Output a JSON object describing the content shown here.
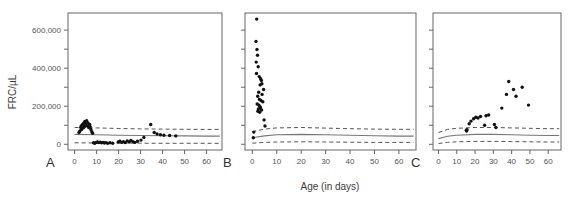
{
  "figure": {
    "xlabel": "Age (in days)",
    "ylabel": "FRC/µL",
    "panel_labels": [
      "A",
      "B",
      "C"
    ]
  },
  "chart_data": [
    {
      "type": "scatter",
      "panel": "A",
      "title": "",
      "xlabel": "Age (in days)",
      "ylabel": "FRC/µL",
      "xlim": [
        -3,
        67
      ],
      "ylim": [
        -30000,
        690000
      ],
      "xticks": [
        0,
        10,
        20,
        30,
        40,
        50,
        60
      ],
      "xtick_labels": [
        "0",
        "10",
        "20",
        "30",
        "40",
        "50",
        "60"
      ],
      "yticks": [
        0,
        200000,
        400000,
        600000
      ],
      "ytick_labels": [
        "0",
        "200,000",
        "400,000",
        "600,000"
      ],
      "yminor_ticks": [
        100000,
        300000,
        500000,
        700000
      ],
      "grid": false,
      "legend": "none",
      "points": [
        [
          2.0,
          62000
        ],
        [
          2.4,
          70000
        ],
        [
          2.8,
          88000
        ],
        [
          3.0,
          96000
        ],
        [
          3.2,
          78000
        ],
        [
          3.6,
          104000
        ],
        [
          3.9,
          86000
        ],
        [
          4.2,
          112000
        ],
        [
          4.4,
          92000
        ],
        [
          4.7,
          120000
        ],
        [
          4.9,
          100000
        ],
        [
          5.2,
          108000
        ],
        [
          5.5,
          124000
        ],
        [
          5.8,
          96000
        ],
        [
          6.1,
          112000
        ],
        [
          6.4,
          88000
        ],
        [
          6.8,
          104000
        ],
        [
          7.1,
          92000
        ],
        [
          7.4,
          78000
        ],
        [
          7.8,
          66000
        ],
        [
          8.2,
          58000
        ],
        [
          8.6,
          8000
        ],
        [
          9.2,
          6000
        ],
        [
          9.8,
          10000
        ],
        [
          10.4,
          12000
        ],
        [
          11.0,
          9000
        ],
        [
          11.6,
          11000
        ],
        [
          12.2,
          8000
        ],
        [
          12.9,
          10000
        ],
        [
          13.5,
          7000
        ],
        [
          14.2,
          9000
        ],
        [
          15.0,
          6000
        ],
        [
          16.1,
          8000
        ],
        [
          17.3,
          5000
        ],
        [
          19.8,
          12000
        ],
        [
          20.6,
          16000
        ],
        [
          21.4,
          10000
        ],
        [
          22.2,
          14000
        ],
        [
          23.0,
          9000
        ],
        [
          23.9,
          18000
        ],
        [
          24.8,
          12000
        ],
        [
          25.6,
          20000
        ],
        [
          26.5,
          14000
        ],
        [
          27.4,
          10000
        ],
        [
          28.6,
          16000
        ],
        [
          30.2,
          22000
        ],
        [
          31.5,
          36000
        ],
        [
          34.6,
          104000
        ],
        [
          36.2,
          62000
        ],
        [
          37.5,
          54000
        ],
        [
          39.0,
          50000
        ],
        [
          40.6,
          48000
        ],
        [
          43.2,
          46000
        ],
        [
          46.0,
          44000
        ]
      ],
      "reference_band": {
        "center": [
          [
            0,
            52000
          ],
          [
            10,
            50000
          ],
          [
            20,
            48000
          ],
          [
            30,
            46000
          ],
          [
            40,
            45000
          ],
          [
            50,
            44000
          ],
          [
            60,
            43000
          ],
          [
            66,
            43000
          ]
        ],
        "upper": [
          [
            0,
            88000
          ],
          [
            10,
            86000
          ],
          [
            20,
            83000
          ],
          [
            30,
            81000
          ],
          [
            40,
            80000
          ],
          [
            50,
            79000
          ],
          [
            60,
            78000
          ],
          [
            66,
            78000
          ]
        ],
        "lower": [
          [
            0,
            8000
          ],
          [
            10,
            7000
          ],
          [
            20,
            6000
          ],
          [
            30,
            6000
          ],
          [
            40,
            5000
          ],
          [
            50,
            5000
          ],
          [
            60,
            5000
          ],
          [
            66,
            5000
          ]
        ]
      }
    },
    {
      "type": "scatter",
      "panel": "B",
      "title": "",
      "xlabel": "Age (in days)",
      "ylabel": "FRC/µL",
      "xlim": [
        -3,
        67
      ],
      "ylim": [
        -30000,
        690000
      ],
      "xticks": [
        0,
        10,
        20,
        30,
        40,
        50,
        60
      ],
      "xtick_labels": [
        "0",
        "10",
        "20",
        "30",
        "40",
        "50",
        "60"
      ],
      "yticks": [
        0,
        200000,
        400000,
        600000
      ],
      "ytick_labels": [
        "0",
        "200,000",
        "400,000",
        "600,000"
      ],
      "yminor_ticks": [
        100000,
        300000,
        500000,
        700000
      ],
      "grid": false,
      "legend": "none",
      "points": [
        [
          1.8,
          658000
        ],
        [
          1.5,
          540000
        ],
        [
          1.9,
          498000
        ],
        [
          2.1,
          468000
        ],
        [
          1.6,
          432000
        ],
        [
          2.4,
          408000
        ],
        [
          1.7,
          372000
        ],
        [
          2.8,
          356000
        ],
        [
          3.4,
          344000
        ],
        [
          3.7,
          336000
        ],
        [
          3.9,
          318000
        ],
        [
          3.2,
          312000
        ],
        [
          4.6,
          288000
        ],
        [
          2.6,
          274000
        ],
        [
          4.0,
          262000
        ],
        [
          2.2,
          252000
        ],
        [
          2.9,
          236000
        ],
        [
          3.5,
          230000
        ],
        [
          4.3,
          224000
        ],
        [
          2.0,
          212000
        ],
        [
          2.7,
          206000
        ],
        [
          3.1,
          198000
        ],
        [
          3.3,
          192000
        ],
        [
          2.5,
          186000
        ],
        [
          3.8,
          180000
        ],
        [
          2.3,
          174000
        ],
        [
          3.0,
          168000
        ],
        [
          4.8,
          128000
        ],
        [
          5.2,
          96000
        ],
        [
          0.6,
          64000
        ],
        [
          0.4,
          34000
        ]
      ],
      "reference_band": {
        "center": [
          [
            0,
            34000
          ],
          [
            5,
            44000
          ],
          [
            10,
            50000
          ],
          [
            20,
            52000
          ],
          [
            30,
            50000
          ],
          [
            40,
            47000
          ],
          [
            50,
            45000
          ],
          [
            60,
            43000
          ],
          [
            66,
            43000
          ]
        ],
        "upper": [
          [
            0,
            66000
          ],
          [
            5,
            80000
          ],
          [
            10,
            86000
          ],
          [
            20,
            88000
          ],
          [
            30,
            85000
          ],
          [
            40,
            82000
          ],
          [
            50,
            80000
          ],
          [
            60,
            79000
          ],
          [
            66,
            79000
          ]
        ],
        "lower": [
          [
            0,
            6000
          ],
          [
            5,
            10000
          ],
          [
            10,
            12000
          ],
          [
            20,
            13000
          ],
          [
            30,
            12000
          ],
          [
            40,
            11000
          ],
          [
            50,
            10000
          ],
          [
            60,
            10000
          ],
          [
            66,
            10000
          ]
        ]
      }
    },
    {
      "type": "scatter",
      "panel": "C",
      "title": "",
      "xlabel": "Age (in days)",
      "ylabel": "FRC/µL",
      "xlim": [
        -3,
        67
      ],
      "ylim": [
        -30000,
        690000
      ],
      "xticks": [
        0,
        10,
        20,
        30,
        40,
        50,
        60
      ],
      "xtick_labels": [
        "0",
        "10",
        "20",
        "30",
        "40",
        "50",
        "60"
      ],
      "yticks": [
        0,
        200000,
        400000,
        600000
      ],
      "ytick_labels": [
        "0",
        "200,000",
        "400,000",
        "600,000"
      ],
      "yminor_ticks": [
        100000,
        300000,
        500000,
        700000
      ],
      "grid": false,
      "legend": "none",
      "points": [
        [
          15.2,
          74000
        ],
        [
          15.4,
          70000
        ],
        [
          15.6,
          76000
        ],
        [
          16.8,
          108000
        ],
        [
          17.8,
          122000
        ],
        [
          19.2,
          134000
        ],
        [
          20.4,
          142000
        ],
        [
          21.6,
          138000
        ],
        [
          23.0,
          146000
        ],
        [
          25.2,
          100000
        ],
        [
          26.0,
          150000
        ],
        [
          27.4,
          154000
        ],
        [
          30.6,
          104000
        ],
        [
          31.4,
          88000
        ],
        [
          34.6,
          190000
        ],
        [
          37.2,
          262000
        ],
        [
          38.4,
          330000
        ],
        [
          41.0,
          288000
        ],
        [
          42.4,
          252000
        ],
        [
          45.8,
          300000
        ],
        [
          49.2,
          206000
        ]
      ],
      "reference_band": {
        "center": [
          [
            0,
            30000
          ],
          [
            5,
            42000
          ],
          [
            10,
            48000
          ],
          [
            20,
            52000
          ],
          [
            30,
            52000
          ],
          [
            40,
            50000
          ],
          [
            50,
            48000
          ],
          [
            60,
            46000
          ],
          [
            66,
            46000
          ]
        ],
        "upper": [
          [
            0,
            62000
          ],
          [
            5,
            78000
          ],
          [
            10,
            84000
          ],
          [
            20,
            88000
          ],
          [
            30,
            88000
          ],
          [
            40,
            86000
          ],
          [
            50,
            84000
          ],
          [
            60,
            82000
          ],
          [
            66,
            82000
          ]
        ],
        "lower": [
          [
            0,
            4000
          ],
          [
            5,
            10000
          ],
          [
            10,
            13000
          ],
          [
            20,
            15000
          ],
          [
            30,
            15000
          ],
          [
            40,
            14000
          ],
          [
            50,
            13000
          ],
          [
            60,
            12000
          ],
          [
            66,
            12000
          ]
        ]
      }
    }
  ]
}
